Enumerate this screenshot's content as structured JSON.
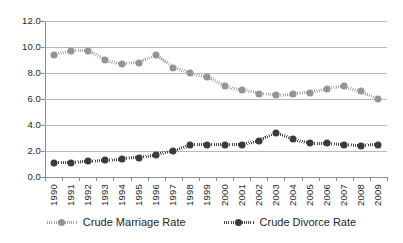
{
  "chart_data": {
    "type": "line",
    "title": "",
    "subtitle": "",
    "xlabel": "",
    "ylabel": "",
    "ylim": [
      0.0,
      12.0
    ],
    "ytick_step": 2.0,
    "ytick_labels": [
      "12.0",
      "10.0",
      "8.0",
      "6.0",
      "4.0",
      "2.0",
      "0.0"
    ],
    "ytick_values": [
      12.0,
      10.0,
      8.0,
      6.0,
      4.0,
      2.0,
      0.0
    ],
    "grid": true,
    "grid_axis": "y",
    "legend_position": "bottom-center",
    "categories": [
      "1990",
      "1991",
      "1992",
      "1993",
      "1994",
      "1995",
      "1996",
      "1997",
      "1998",
      "1999",
      "2000",
      "2001",
      "2002",
      "2003",
      "2004",
      "2005",
      "2006",
      "2007",
      "2008",
      "2009"
    ],
    "series": [
      {
        "name": "Crude Marriage Rate",
        "color": "#949494",
        "line_color": "#a8a8a8",
        "line_style": "dotted",
        "marker": "circle",
        "values": [
          9.4,
          9.7,
          9.7,
          9.0,
          8.7,
          8.8,
          9.4,
          8.4,
          8.0,
          7.7,
          7.0,
          6.7,
          6.4,
          6.3,
          6.4,
          6.5,
          6.8,
          7.0,
          6.6,
          6.0
        ]
      },
      {
        "name": "Crude Divorce Rate",
        "color": "#3b3b3b",
        "line_color": "#4a4a4a",
        "line_style": "dotted",
        "marker": "circle",
        "values": [
          1.1,
          1.1,
          1.2,
          1.3,
          1.4,
          1.5,
          1.7,
          2.0,
          2.5,
          2.5,
          2.5,
          2.5,
          2.8,
          3.4,
          2.9,
          2.6,
          2.6,
          2.5,
          2.4,
          2.5
        ]
      }
    ]
  },
  "legend": {
    "entries": [
      {
        "label": "Crude Marriage Rate"
      },
      {
        "label": "Crude Divorce Rate"
      }
    ]
  }
}
